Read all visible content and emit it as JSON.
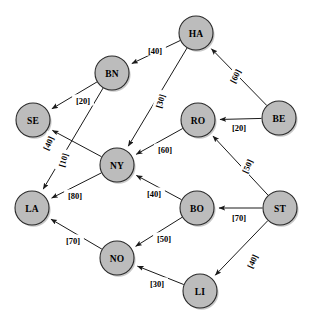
{
  "diagram": {
    "node_fill": "#bcbcbc",
    "node_stroke": "#2a2a2a",
    "edge_color": "#1a1a1a",
    "background": "#ffffff",
    "nodes": [
      {
        "id": "HA",
        "label": "HA",
        "cx": 196,
        "cy": 33,
        "r": 17
      },
      {
        "id": "BN",
        "label": "BN",
        "cx": 112,
        "cy": 73,
        "r": 17
      },
      {
        "id": "SE",
        "label": "SE",
        "cx": 33,
        "cy": 120,
        "r": 17
      },
      {
        "id": "RO",
        "label": "RO",
        "cx": 198,
        "cy": 120,
        "r": 17
      },
      {
        "id": "BE",
        "label": "BE",
        "cx": 279,
        "cy": 118,
        "r": 17
      },
      {
        "id": "NY",
        "label": "NY",
        "cx": 117,
        "cy": 165,
        "r": 17
      },
      {
        "id": "LA",
        "label": "LA",
        "cx": 32,
        "cy": 208,
        "r": 17
      },
      {
        "id": "BO",
        "label": "BO",
        "cx": 197,
        "cy": 208,
        "r": 17
      },
      {
        "id": "ST",
        "label": "ST",
        "cx": 280,
        "cy": 208,
        "r": 17
      },
      {
        "id": "NO",
        "label": "NO",
        "cx": 117,
        "cy": 258,
        "r": 17
      },
      {
        "id": "LI",
        "label": "LI",
        "cx": 200,
        "cy": 291,
        "r": 17
      }
    ],
    "edges": [
      {
        "from": "HA",
        "to": "BN",
        "weight": 40,
        "label": "[40]",
        "lx": 155,
        "ly": 50,
        "rot": 0
      },
      {
        "from": "HA",
        "to": "NY",
        "weight": 30,
        "label": "[30]",
        "lx": 160,
        "ly": 101,
        "rot": -73
      },
      {
        "from": "BE",
        "to": "HA",
        "weight": 60,
        "label": "[60]",
        "lx": 235,
        "ly": 76,
        "rot": -63
      },
      {
        "from": "BN",
        "to": "SE",
        "weight": 20,
        "label": "[20]",
        "lx": 83,
        "ly": 100,
        "rot": 0
      },
      {
        "from": "BN",
        "to": "LA",
        "weight": 10,
        "label": "[10]",
        "lx": 63,
        "ly": 160,
        "rot": -73
      },
      {
        "from": "BE",
        "to": "RO",
        "weight": 20,
        "label": "[20]",
        "lx": 239,
        "ly": 127,
        "rot": 0
      },
      {
        "from": "NY",
        "to": "SE",
        "weight": 40,
        "label": "[40]",
        "lx": 48,
        "ly": 143,
        "rot": -66
      },
      {
        "from": "RO",
        "to": "NY",
        "weight": 60,
        "label": "[60]",
        "lx": 165,
        "ly": 149,
        "rot": 0
      },
      {
        "from": "ST",
        "to": "RO",
        "weight": 50,
        "label": "[50]",
        "lx": 247,
        "ly": 166,
        "rot": -66
      },
      {
        "from": "NY",
        "to": "LA",
        "weight": 80,
        "label": "[80]",
        "lx": 75,
        "ly": 195,
        "rot": 0
      },
      {
        "from": "BO",
        "to": "NY",
        "weight": 40,
        "label": "[40]",
        "lx": 154,
        "ly": 193,
        "rot": 0
      },
      {
        "from": "ST",
        "to": "BO",
        "weight": 70,
        "label": "[70]",
        "lx": 239,
        "ly": 217,
        "rot": 0
      },
      {
        "from": "BO",
        "to": "NO",
        "weight": 50,
        "label": "[50]",
        "lx": 164,
        "ly": 238,
        "rot": 0
      },
      {
        "from": "NO",
        "to": "LA",
        "weight": 70,
        "label": "[70]",
        "lx": 73,
        "ly": 240,
        "rot": 0
      },
      {
        "from": "ST",
        "to": "LI",
        "weight": 40,
        "label": "[40]",
        "lx": 252,
        "ly": 261,
        "rot": -65
      },
      {
        "from": "LI",
        "to": "NO",
        "weight": 30,
        "label": "[30]",
        "lx": 157,
        "ly": 283,
        "rot": 0
      }
    ]
  }
}
